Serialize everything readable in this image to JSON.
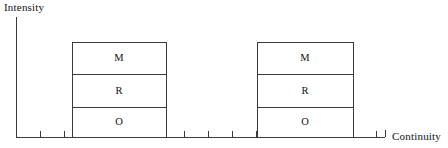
{
  "figure": {
    "background": "#ffffff",
    "line_color": "#3a3a3a",
    "text_color": "#111111",
    "width": 448,
    "height": 148
  },
  "axes": {
    "y_label": "Intensity",
    "x_label": "Continuity",
    "y_axis": {
      "x": 16,
      "y_top": 17,
      "y_bottom": 137
    },
    "x_axis": {
      "y": 137,
      "x_start": 16,
      "x_end": 385
    },
    "tick_length": 6,
    "tick_positions": [
      40,
      64,
      88,
      112,
      136,
      160,
      184,
      208,
      232,
      256,
      280,
      304,
      328,
      352,
      376
    ],
    "end_cap": {
      "x": 385,
      "height": 7
    }
  },
  "chart_data": {
    "type": "bar",
    "title": "",
    "xlabel": "Continuity",
    "ylabel": "Intensity",
    "stacked": true,
    "grid": false,
    "legend": "none",
    "segment_order_bottom_to_top": [
      "O",
      "R",
      "M"
    ],
    "categories": [
      "bar-1",
      "bar-2"
    ],
    "bars": [
      {
        "name": "bar-1",
        "x_left": 72,
        "x_right": 166,
        "y_top": 42,
        "y_bottom": 137,
        "segments": [
          {
            "label": "M",
            "y_top": 42,
            "y_bottom": 74,
            "center_x": 119,
            "center_y": 58
          },
          {
            "label": "R",
            "y_top": 74,
            "y_bottom": 107,
            "center_x": 119,
            "center_y": 91
          },
          {
            "label": "O",
            "y_top": 107,
            "y_bottom": 137,
            "center_x": 119,
            "center_y": 122
          }
        ]
      },
      {
        "name": "bar-2",
        "x_left": 257,
        "x_right": 353,
        "y_top": 42,
        "y_bottom": 137,
        "segments": [
          {
            "label": "M",
            "y_top": 42,
            "y_bottom": 74,
            "center_x": 305,
            "center_y": 58
          },
          {
            "label": "R",
            "y_top": 74,
            "y_bottom": 107,
            "center_x": 305,
            "center_y": 91
          },
          {
            "label": "O",
            "y_top": 107,
            "y_bottom": 137,
            "center_x": 305,
            "center_y": 122
          }
        ]
      }
    ],
    "series": [
      {
        "name": "O",
        "values": [
          30,
          30
        ]
      },
      {
        "name": "R",
        "values": [
          33,
          33
        ]
      },
      {
        "name": "M",
        "values": [
          32,
          32
        ]
      }
    ]
  }
}
